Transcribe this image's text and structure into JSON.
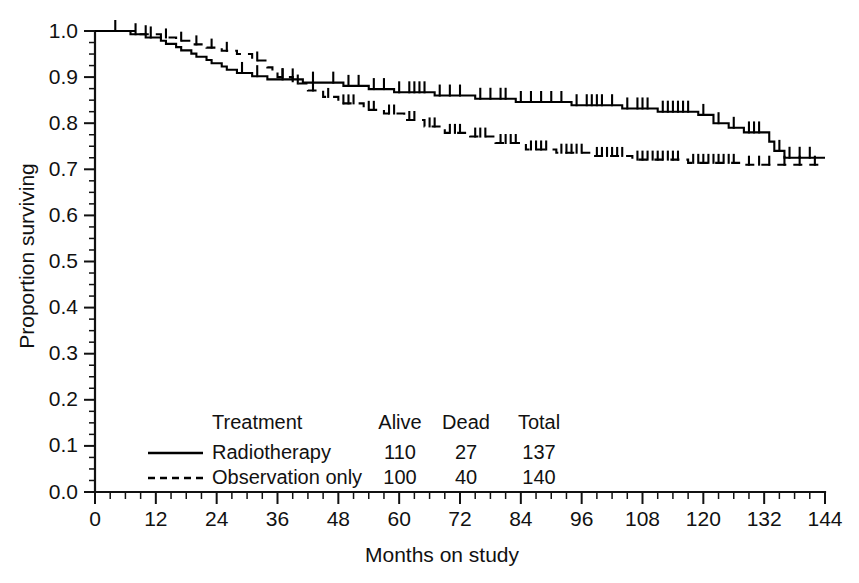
{
  "chart_data": {
    "type": "line",
    "title": "",
    "subtitle": "",
    "xlabel": "Months on study",
    "ylabel": "Proportion surviving",
    "xlim": [
      0,
      144
    ],
    "ylim": [
      0.0,
      1.0
    ],
    "x_ticks": [
      0,
      12,
      24,
      36,
      48,
      60,
      72,
      84,
      96,
      108,
      120,
      132,
      144
    ],
    "x_tick_labels": [
      "0",
      "12",
      "24",
      "36",
      "48",
      "60",
      "72",
      "84",
      "96",
      "108",
      "120",
      "132",
      "144"
    ],
    "x_minor_step": 3,
    "y_ticks": [
      0.0,
      0.1,
      0.2,
      0.3,
      0.4,
      0.5,
      0.6,
      0.7,
      0.8,
      0.9,
      1.0
    ],
    "y_tick_labels": [
      "0.0",
      "0.1",
      "0.2",
      "0.3",
      "0.4",
      "0.5",
      "0.6",
      "0.7",
      "0.8",
      "0.9",
      "1.0"
    ],
    "y_minor_step": 0.025,
    "grid": false,
    "legend_position": "lower-center-inside",
    "plot_style": "kaplan-meier-step",
    "series": [
      {
        "name": "Radiotherapy",
        "line_style": "solid",
        "color": "#000000",
        "alive": 110,
        "dead": 27,
        "total": 137,
        "steps": [
          [
            0,
            1.0
          ],
          [
            6,
            1.0
          ],
          [
            7,
            0.993
          ],
          [
            9,
            0.993
          ],
          [
            10,
            0.986
          ],
          [
            12,
            0.986
          ],
          [
            13,
            0.979
          ],
          [
            14,
            0.972
          ],
          [
            15,
            0.972
          ],
          [
            16,
            0.965
          ],
          [
            17,
            0.958
          ],
          [
            18,
            0.958
          ],
          [
            19,
            0.951
          ],
          [
            20,
            0.944
          ],
          [
            21,
            0.944
          ],
          [
            22,
            0.937
          ],
          [
            23,
            0.93
          ],
          [
            24,
            0.93
          ],
          [
            25,
            0.923
          ],
          [
            26,
            0.916
          ],
          [
            27,
            0.916
          ],
          [
            28,
            0.909
          ],
          [
            30,
            0.909
          ],
          [
            31,
            0.902
          ],
          [
            33,
            0.902
          ],
          [
            34,
            0.895
          ],
          [
            40,
            0.895
          ],
          [
            41,
            0.888
          ],
          [
            45,
            0.888
          ],
          [
            46,
            0.888
          ],
          [
            48,
            0.888
          ],
          [
            49,
            0.881
          ],
          [
            53,
            0.881
          ],
          [
            54,
            0.874
          ],
          [
            58,
            0.874
          ],
          [
            59,
            0.867
          ],
          [
            66,
            0.867
          ],
          [
            67,
            0.86
          ],
          [
            74,
            0.86
          ],
          [
            75,
            0.853
          ],
          [
            82,
            0.853
          ],
          [
            83,
            0.846
          ],
          [
            93,
            0.846
          ],
          [
            94,
            0.839
          ],
          [
            103,
            0.839
          ],
          [
            104,
            0.832
          ],
          [
            110,
            0.832
          ],
          [
            111,
            0.825
          ],
          [
            118,
            0.825
          ],
          [
            119,
            0.818
          ],
          [
            121,
            0.818
          ],
          [
            122,
            0.8
          ],
          [
            124,
            0.8
          ],
          [
            125,
            0.79
          ],
          [
            127,
            0.79
          ],
          [
            128,
            0.78
          ],
          [
            132,
            0.78
          ],
          [
            133,
            0.76
          ],
          [
            134,
            0.74
          ],
          [
            136,
            0.725
          ],
          [
            144,
            0.725
          ]
        ],
        "censor_times": [
          4,
          8,
          11,
          29,
          32,
          37,
          39,
          43,
          47,
          50,
          52,
          55,
          57,
          60,
          62,
          63,
          64,
          65,
          68,
          70,
          72,
          76,
          78,
          80,
          81,
          84,
          86,
          88,
          90,
          92,
          95,
          97,
          98,
          99,
          100,
          102,
          105,
          107,
          108,
          109,
          112,
          113,
          114,
          115,
          116,
          117,
          120,
          123,
          126,
          129,
          130,
          131,
          135,
          137,
          139,
          141
        ]
      },
      {
        "name": "Observation only",
        "line_style": "dashed",
        "color": "#000000",
        "alive": 100,
        "dead": 40,
        "total": 140,
        "steps": [
          [
            0,
            1.0
          ],
          [
            8,
            1.0
          ],
          [
            9,
            0.993
          ],
          [
            12,
            0.993
          ],
          [
            13,
            0.986
          ],
          [
            15,
            0.986
          ],
          [
            16,
            0.979
          ],
          [
            18,
            0.979
          ],
          [
            19,
            0.971
          ],
          [
            21,
            0.971
          ],
          [
            22,
            0.964
          ],
          [
            24,
            0.964
          ],
          [
            25,
            0.957
          ],
          [
            27,
            0.957
          ],
          [
            28,
            0.95
          ],
          [
            30,
            0.95
          ],
          [
            31,
            0.936
          ],
          [
            33,
            0.936
          ],
          [
            34,
            0.921
          ],
          [
            35,
            0.914
          ],
          [
            36,
            0.9
          ],
          [
            38,
            0.9
          ],
          [
            39,
            0.886
          ],
          [
            41,
            0.886
          ],
          [
            42,
            0.871
          ],
          [
            44,
            0.871
          ],
          [
            45,
            0.857
          ],
          [
            47,
            0.857
          ],
          [
            48,
            0.843
          ],
          [
            52,
            0.843
          ],
          [
            53,
            0.829
          ],
          [
            56,
            0.829
          ],
          [
            57,
            0.821
          ],
          [
            60,
            0.821
          ],
          [
            61,
            0.807
          ],
          [
            64,
            0.807
          ],
          [
            65,
            0.793
          ],
          [
            68,
            0.793
          ],
          [
            69,
            0.779
          ],
          [
            73,
            0.779
          ],
          [
            74,
            0.771
          ],
          [
            78,
            0.771
          ],
          [
            79,
            0.757
          ],
          [
            84,
            0.757
          ],
          [
            85,
            0.743
          ],
          [
            90,
            0.743
          ],
          [
            91,
            0.736
          ],
          [
            97,
            0.736
          ],
          [
            98,
            0.729
          ],
          [
            105,
            0.729
          ],
          [
            106,
            0.721
          ],
          [
            116,
            0.721
          ],
          [
            117,
            0.714
          ],
          [
            127,
            0.714
          ],
          [
            128,
            0.71
          ],
          [
            144,
            0.71
          ]
        ],
        "censor_times": [
          10,
          14,
          17,
          20,
          23,
          26,
          32,
          37,
          40,
          43,
          46,
          49,
          50,
          51,
          54,
          55,
          58,
          59,
          62,
          63,
          66,
          67,
          70,
          71,
          72,
          75,
          76,
          77,
          80,
          81,
          82,
          83,
          86,
          87,
          88,
          89,
          92,
          93,
          94,
          95,
          96,
          99,
          100,
          101,
          102,
          103,
          104,
          107,
          108,
          109,
          110,
          111,
          112,
          113,
          114,
          115,
          118,
          119,
          120,
          121,
          122,
          123,
          124,
          125,
          126,
          129,
          131,
          133,
          136,
          139,
          142
        ]
      }
    ]
  },
  "legend": {
    "headers": {
      "treatment": "Treatment",
      "alive": "Alive",
      "dead": "Dead",
      "total": "Total"
    },
    "rows": [
      {
        "label": "Radiotherapy",
        "alive": "110",
        "dead": "27",
        "total": "137",
        "style": "solid"
      },
      {
        "label": "Observation only",
        "alive": "100",
        "dead": "40",
        "total": "140",
        "style": "dashed"
      }
    ]
  },
  "colors": {
    "ink": "#000000",
    "axis": "#111111",
    "background": "#ffffff"
  }
}
